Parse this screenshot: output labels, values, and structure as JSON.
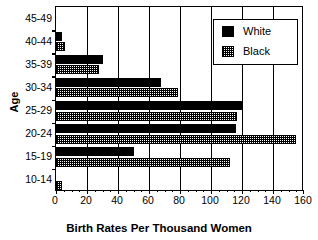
{
  "chart_data": {
    "type": "bar",
    "orientation": "horizontal",
    "title": "",
    "xlabel": "Birth Rates Per Thousand Women",
    "ylabel": "Age",
    "categories": [
      "45-49",
      "40-44",
      "35-39",
      "30-34",
      "25-29",
      "20-24",
      "15-19",
      "10-14"
    ],
    "series": [
      {
        "name": "White",
        "fill": "solid-black",
        "values": [
          0,
          4,
          30,
          68,
          120,
          116,
          50,
          0
        ]
      },
      {
        "name": "Black",
        "fill": "dotted-hatch",
        "values": [
          0,
          6,
          28,
          79,
          117,
          155,
          112,
          4
        ]
      }
    ],
    "xlim": [
      0,
      160
    ],
    "xticks": [
      0,
      20,
      40,
      60,
      80,
      100,
      120,
      140,
      160
    ],
    "xtick_labels": [
      "0",
      "20",
      "40",
      "60",
      "80",
      "100",
      "120",
      "140",
      "160"
    ],
    "x_minor_tick_step": 5,
    "grid": "vertical-major",
    "legend_position": "top-right",
    "legend_entries": [
      "White",
      "Black"
    ],
    "colors": {
      "white_series": "#000000",
      "black_series": "#ffffff",
      "axis": "#000000",
      "background": "#ffffff"
    }
  },
  "legend": {
    "white_label": "White",
    "black_label": "Black"
  }
}
